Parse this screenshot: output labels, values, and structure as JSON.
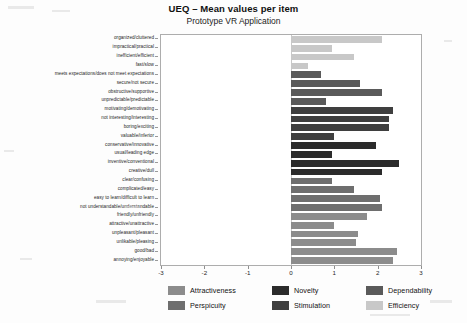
{
  "title": "UEQ – Mean values per item",
  "subtitle": "Prototype VR Application",
  "axis": {
    "ticks": [
      "-3",
      "-2",
      "-1",
      "0",
      "1",
      "2",
      "3"
    ],
    "min": -3,
    "max": 3
  },
  "legend": {
    "items": [
      {
        "label": "Attractiveness",
        "color": "#8c8c8c"
      },
      {
        "label": "Perspicuity",
        "color": "#6e6e6e"
      },
      {
        "label": "Novelty",
        "color": "#2b2b2b"
      },
      {
        "label": "Stimulation",
        "color": "#3f3f3f"
      },
      {
        "label": "Dependability",
        "color": "#5a5a5a"
      },
      {
        "label": "Efficiency",
        "color": "#c8c8c8"
      }
    ]
  },
  "chart_data": {
    "type": "bar",
    "orientation": "horizontal",
    "title": "UEQ – Mean values per item",
    "subtitle": "Prototype VR Application",
    "xlabel": "",
    "ylabel": "",
    "xlim": [
      -3,
      3
    ],
    "xticks": [
      -3,
      -2,
      -1,
      0,
      1,
      2,
      3
    ],
    "grid": false,
    "legend_position": "bottom",
    "categories": [
      "organized/cluttered",
      "impractical/practical",
      "inefficient/efficient",
      "fast/slow",
      "meets expectations/does not meet expectations",
      "secure/not secure",
      "obstructive/supportive",
      "unpredictable/predictable",
      "motivating/demotivating",
      "not interesting/interesting",
      "boring/exciting",
      "valuable/inferior",
      "conservative/innovative",
      "usual/leading edge",
      "inventive/conventional",
      "creative/dull",
      "clear/confusing",
      "complicated/easy",
      "easy to learn/difficult to learn",
      "not understandable/understandable",
      "friendly/unfriendly",
      "attractive/unattractive",
      "unpleasant/pleasant",
      "unlikable/pleasing",
      "good/bad",
      "annoying/enjoyable"
    ],
    "values": [
      2.1,
      0.95,
      1.45,
      0.4,
      0.7,
      1.6,
      2.1,
      0.8,
      2.35,
      2.25,
      2.25,
      1.0,
      1.95,
      0.95,
      2.5,
      2.1,
      0.95,
      1.45,
      2.05,
      2.1,
      1.75,
      1.0,
      1.55,
      1.5,
      2.45,
      2.35
    ],
    "scales": [
      "Efficiency",
      "Efficiency",
      "Efficiency",
      "Efficiency",
      "Dependability",
      "Dependability",
      "Dependability",
      "Dependability",
      "Stimulation",
      "Stimulation",
      "Stimulation",
      "Stimulation",
      "Novelty",
      "Novelty",
      "Novelty",
      "Novelty",
      "Perspicuity",
      "Perspicuity",
      "Perspicuity",
      "Perspicuity",
      "Attractiveness",
      "Attractiveness",
      "Attractiveness",
      "Attractiveness",
      "Attractiveness",
      "Attractiveness"
    ],
    "colors": [
      "#c8c8c8",
      "#c8c8c8",
      "#c8c8c8",
      "#c8c8c8",
      "#5a5a5a",
      "#5a5a5a",
      "#5a5a5a",
      "#5a5a5a",
      "#3f3f3f",
      "#3f3f3f",
      "#3f3f3f",
      "#3f3f3f",
      "#2b2b2b",
      "#2b2b2b",
      "#2b2b2b",
      "#2b2b2b",
      "#6e6e6e",
      "#6e6e6e",
      "#6e6e6e",
      "#6e6e6e",
      "#8c8c8c",
      "#8c8c8c",
      "#8c8c8c",
      "#8c8c8c",
      "#8c8c8c",
      "#8c8c8c"
    ]
  }
}
